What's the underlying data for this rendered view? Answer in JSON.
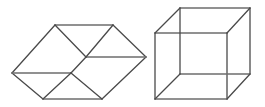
{
  "page": {
    "background_color": "#ffffff",
    "width": 265,
    "height": 107,
    "figure_count": 2
  },
  "style": {
    "stroke_color": "#4a4a4a",
    "stroke_color_light": "#6e6e6e",
    "stroke_width": 1.3,
    "fill": "none"
  },
  "figures": [
    {
      "id": "folded-hexagon",
      "name": "Ambiguous folded hexagon figure",
      "description": "Two rhombi joined along a slightly offset shared diagonal forming an ambiguous hexagonal solid",
      "bounds": {
        "x": 12,
        "y": 25,
        "width": 134,
        "height": 74
      },
      "vertices": {
        "left": [
          12,
          73
        ],
        "top_left": [
          55,
          25
        ],
        "top_right": [
          113,
          25
        ],
        "right": [
          146,
          57
        ],
        "bottom_left": [
          43,
          99
        ],
        "bottom_right": [
          102,
          99
        ],
        "center_upper": [
          86,
          57
        ],
        "center_lower": [
          71,
          73
        ]
      },
      "edges": [
        {
          "name": "outer-top",
          "from": [
            55,
            25
          ],
          "to": [
            113,
            25
          ]
        },
        {
          "name": "outer-upper-left",
          "from": [
            12,
            73
          ],
          "to": [
            55,
            25
          ]
        },
        {
          "name": "outer-upper-right",
          "from": [
            113,
            25
          ],
          "to": [
            146,
            57
          ]
        },
        {
          "name": "outer-lower-left",
          "from": [
            12,
            73
          ],
          "to": [
            43,
            99
          ]
        },
        {
          "name": "outer-bottom",
          "from": [
            43,
            99
          ],
          "to": [
            102,
            99
          ]
        },
        {
          "name": "outer-lower-right",
          "from": [
            102,
            99
          ],
          "to": [
            146,
            57
          ]
        },
        {
          "name": "inner-horizontal-left",
          "from": [
            12,
            73
          ],
          "to": [
            71,
            73
          ]
        },
        {
          "name": "inner-horizontal-right",
          "from": [
            86,
            57
          ],
          "to": [
            146,
            57
          ]
        },
        {
          "name": "inner-diagonal-top-left",
          "from": [
            55,
            25
          ],
          "to": [
            86,
            57
          ]
        },
        {
          "name": "inner-diagonal-top-right",
          "from": [
            113,
            25
          ],
          "to": [
            86,
            57
          ]
        },
        {
          "name": "inner-diagonal-bottom-left",
          "from": [
            43,
            99
          ],
          "to": [
            71,
            73
          ]
        },
        {
          "name": "inner-diagonal-bottom-right",
          "from": [
            102,
            99
          ],
          "to": [
            71,
            73
          ]
        },
        {
          "name": "inner-offset-link",
          "from": [
            71,
            73
          ],
          "to": [
            86,
            57
          ]
        }
      ]
    },
    {
      "id": "necker-cube",
      "name": "Transparent wireframe cube",
      "description": "Necker cube drawn in transparent wireframe with back face offset up and to the right",
      "bounds": {
        "x": 155,
        "y": 8,
        "width": 95,
        "height": 91
      },
      "vertices": {
        "front_top_left": [
          155,
          33
        ],
        "front_top_right": [
          227,
          33
        ],
        "front_bottom_left": [
          155,
          99
        ],
        "front_bottom_right": [
          227,
          99
        ],
        "back_top_left": [
          180,
          8
        ],
        "back_top_right": [
          250,
          8
        ],
        "back_bottom_left": [
          180,
          74
        ],
        "back_bottom_right": [
          250,
          74
        ]
      },
      "edges": [
        {
          "name": "front-top",
          "from": [
            155,
            33
          ],
          "to": [
            227,
            33
          ]
        },
        {
          "name": "front-right",
          "from": [
            227,
            33
          ],
          "to": [
            227,
            99
          ]
        },
        {
          "name": "front-bottom",
          "from": [
            155,
            99
          ],
          "to": [
            227,
            99
          ]
        },
        {
          "name": "front-left",
          "from": [
            155,
            33
          ],
          "to": [
            155,
            99
          ]
        },
        {
          "name": "back-top",
          "from": [
            180,
            8
          ],
          "to": [
            250,
            8
          ]
        },
        {
          "name": "back-right",
          "from": [
            250,
            8
          ],
          "to": [
            250,
            74
          ]
        },
        {
          "name": "back-bottom",
          "from": [
            180,
            74
          ],
          "to": [
            250,
            74
          ]
        },
        {
          "name": "back-left",
          "from": [
            180,
            8
          ],
          "to": [
            180,
            74
          ]
        },
        {
          "name": "connector-top-left",
          "from": [
            155,
            33
          ],
          "to": [
            180,
            8
          ]
        },
        {
          "name": "connector-top-right",
          "from": [
            227,
            33
          ],
          "to": [
            250,
            8
          ]
        },
        {
          "name": "connector-bottom-left",
          "from": [
            155,
            99
          ],
          "to": [
            180,
            74
          ]
        },
        {
          "name": "connector-bottom-right",
          "from": [
            227,
            99
          ],
          "to": [
            250,
            74
          ]
        }
      ]
    }
  ]
}
